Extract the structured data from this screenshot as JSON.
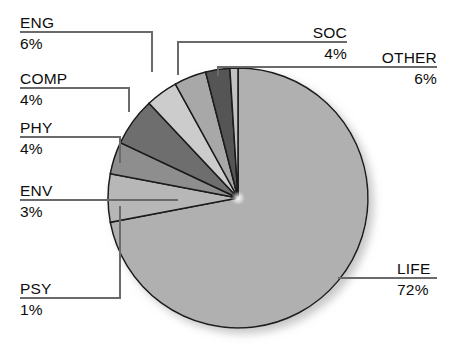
{
  "chart_data": {
    "type": "pie",
    "title": "",
    "subtitle": "",
    "xlabel": "",
    "ylabel": "",
    "legend_position": "callout-labels",
    "grid": false,
    "unit": "%",
    "start_angle_deg": 0,
    "direction": "clockwise",
    "categories": [
      "LIFE",
      "OTHER",
      "SOC",
      "ENG",
      "COMP",
      "PHY",
      "ENV",
      "PSY"
    ],
    "values": [
      72,
      6,
      4,
      6,
      4,
      4,
      3,
      1
    ],
    "slices": [
      {
        "label": "LIFE",
        "value": 72,
        "value_text": "72%",
        "color": "#b0b0b0"
      },
      {
        "label": "OTHER",
        "value": 6,
        "value_text": "6%",
        "color": "#b7b7b7"
      },
      {
        "label": "SOC",
        "value": 4,
        "value_text": "4%",
        "color": "#8e8e8e"
      },
      {
        "label": "ENG",
        "value": 6,
        "value_text": "6%",
        "color": "#6e6e6e"
      },
      {
        "label": "COMP",
        "value": 4,
        "value_text": "4%",
        "color": "#cccccc"
      },
      {
        "label": "PHY",
        "value": 4,
        "value_text": "4%",
        "color": "#a8a8a8"
      },
      {
        "label": "ENV",
        "value": 3,
        "value_text": "3%",
        "color": "#555555"
      },
      {
        "label": "PSY",
        "value": 1,
        "value_text": "1%",
        "color": "#c2c2c2"
      }
    ]
  },
  "labels": {
    "eng_name": "ENG",
    "eng_pct": "6%",
    "comp_name": "COMP",
    "comp_pct": "4%",
    "phy_name": "PHY",
    "phy_pct": "4%",
    "env_name": "ENV",
    "env_pct": "3%",
    "psy_name": "PSY",
    "psy_pct": "1%",
    "soc_name": "SOC",
    "soc_pct": "4%",
    "other_name": "OTHER",
    "other_pct": "6%",
    "life_name": "LIFE",
    "life_pct": "72%"
  },
  "colors": {
    "outline": "#1a1a1a",
    "leader": "#6a6a6a",
    "text": "#0d0d0d",
    "background": "#ffffff"
  }
}
